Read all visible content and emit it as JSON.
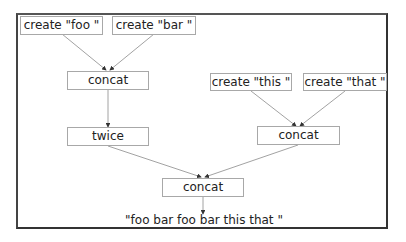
{
  "diagram": {
    "nodes": {
      "create_foo": "create \"foo \"",
      "create_bar": "create \"bar \"",
      "concat1": "concat",
      "twice": "twice",
      "create_this": "create \"this \"",
      "create_that": "create \"that \"",
      "concat2": "concat",
      "concat3": "concat"
    },
    "output": "\"foo bar foo bar this that \"",
    "edges": [
      [
        "create_foo",
        "concat1"
      ],
      [
        "create_bar",
        "concat1"
      ],
      [
        "concat1",
        "twice"
      ],
      [
        "create_this",
        "concat2"
      ],
      [
        "create_that",
        "concat2"
      ],
      [
        "twice",
        "concat3"
      ],
      [
        "concat2",
        "concat3"
      ],
      [
        "concat3",
        "output"
      ]
    ],
    "colors": {
      "edge": "#8a8a8a",
      "node_border": "#a8a8a8",
      "frame": "#444444"
    }
  }
}
